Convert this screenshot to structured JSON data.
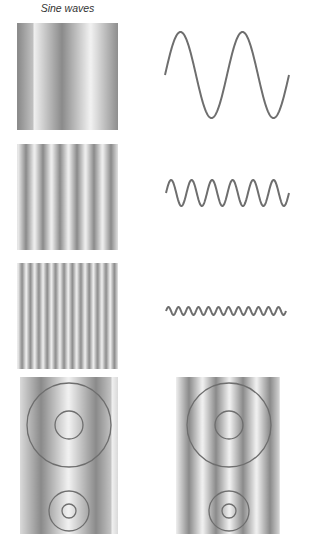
{
  "title": "Sine waves",
  "colors": {
    "background": "#ffffff",
    "stroke": "#6e6e6e",
    "grating_light": "#f2f2f2",
    "grating_dark": "#8a8a8a"
  },
  "rows": [
    {
      "name": "low-frequency",
      "grating": {
        "x": 17,
        "y": 23,
        "w": 101,
        "h": 107,
        "period": 57,
        "phase_dark_x": 62
      },
      "wave": {
        "x0": 165,
        "x1": 289,
        "cy": 75,
        "amplitude": 43,
        "cycles": 2
      }
    },
    {
      "name": "medium-frequency",
      "grating": {
        "x": 17,
        "y": 144,
        "w": 101,
        "h": 106,
        "period": 17,
        "phase_dark_x": 26
      },
      "wave": {
        "x0": 166,
        "x1": 289,
        "cy": 193,
        "amplitude": 13,
        "cycles": 6
      }
    },
    {
      "name": "high-frequency",
      "grating": {
        "x": 17,
        "y": 263,
        "w": 101,
        "h": 106,
        "period": 8.4,
        "phase_dark_x": 22
      },
      "wave": {
        "x0": 166,
        "x1": 286,
        "cy": 311,
        "amplitude": 4,
        "cycles": 12
      }
    }
  ],
  "bottom_panels": [
    {
      "name": "low-frequency-with-circles",
      "grating": {
        "x": 20,
        "y": 377,
        "w": 98,
        "h": 157,
        "period": 55,
        "phase_dark_x": 41
      },
      "circles": [
        {
          "cx": 69,
          "cy": 425,
          "r": 42
        },
        {
          "cx": 69,
          "cy": 425,
          "r": 14
        },
        {
          "cx": 69,
          "cy": 511,
          "r": 20
        },
        {
          "cx": 69,
          "cy": 511,
          "r": 7
        }
      ]
    },
    {
      "name": "medium-frequency-with-circles",
      "grating": {
        "x": 176,
        "y": 377,
        "w": 104,
        "h": 157,
        "period": 27,
        "phase_dark_x": 189
      },
      "circles": [
        {
          "cx": 229,
          "cy": 425,
          "r": 42
        },
        {
          "cx": 229,
          "cy": 425,
          "r": 14
        },
        {
          "cx": 229,
          "cy": 511,
          "r": 20
        },
        {
          "cx": 229,
          "cy": 511,
          "r": 7
        }
      ]
    }
  ]
}
